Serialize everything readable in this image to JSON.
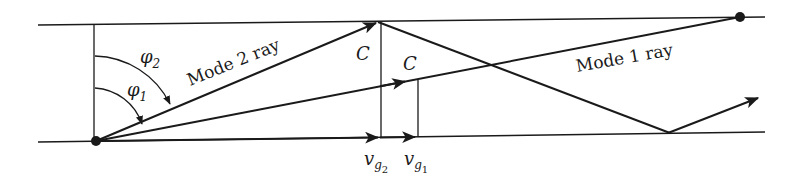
{
  "figure": {
    "labels": {
      "mode2_ray": "Mode 2 ray",
      "mode1_ray": "Mode 1 ray",
      "c_mode2": "C",
      "c_mode1": "C",
      "phi2": "φ",
      "phi2_sub": "2",
      "phi1": "φ",
      "phi1_sub": "1",
      "vg2": "v",
      "vg2_sub": "g",
      "vg2_subsub": "2",
      "vg1": "v",
      "vg1_sub": "g",
      "vg1_subsub": "1"
    },
    "colors": {
      "stroke": "#1a1a1a",
      "background": "#ffffff"
    }
  }
}
